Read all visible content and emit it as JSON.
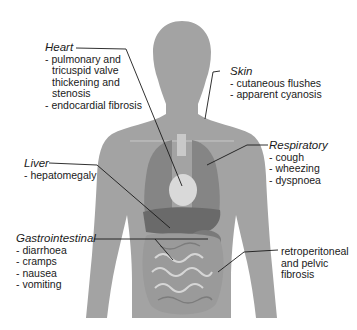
{
  "diagram": {
    "type": "anatomical-annotation",
    "colors": {
      "body": "#a3a3a3",
      "organs": "#6f6f6f",
      "leader_lines": "#1a1a1a",
      "text": "#1a1a1a"
    },
    "labels": {
      "heart": {
        "title": "Heart",
        "items": [
          "- pulmonary and",
          "tricuspid valve",
          "thickening and",
          "stenosis",
          "- endocardial fibrosis"
        ]
      },
      "skin": {
        "title": "Skin",
        "items": [
          "- cutaneous flushes",
          "- apparent cyanosis"
        ]
      },
      "respiratory": {
        "title": "Respiratory",
        "items": [
          "- cough",
          "- wheezing",
          "- dyspnoea"
        ]
      },
      "liver": {
        "title": "Liver",
        "items": [
          "- hepatomegaly"
        ]
      },
      "gastrointestinal": {
        "title": "Gastrointestinal",
        "items": [
          "- diarrhoea",
          "- cramps",
          "- nausea",
          "- vomiting"
        ]
      },
      "retroperitoneal": {
        "items": [
          "retroperitoneal",
          "and pelvic",
          "fibrosis"
        ]
      }
    }
  }
}
